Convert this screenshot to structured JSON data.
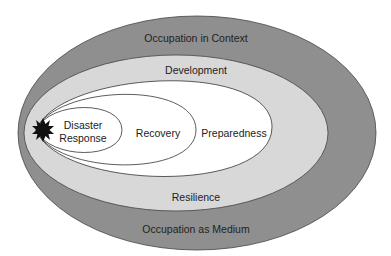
{
  "diagram": {
    "type": "nested-ellipses",
    "layers": {
      "outer": {
        "top_label": "Occupation in Context",
        "bottom_label": "Occupation as Medium",
        "fill": "#8f8f8f"
      },
      "middle": {
        "top_label": "Development",
        "bottom_label": "Resilience",
        "fill": "#d8d8d8"
      },
      "preparedness": {
        "label": "Preparedness",
        "fill": "#ffffff"
      },
      "recovery": {
        "label": "Recovery",
        "fill": "#ffffff"
      },
      "disaster_response": {
        "label_line1": "Disaster",
        "label_line2": "Response",
        "fill": "#ffffff"
      }
    },
    "origin_marker": {
      "icon": "starburst-icon",
      "color": "#111111"
    },
    "stroke_color": "#333333"
  }
}
